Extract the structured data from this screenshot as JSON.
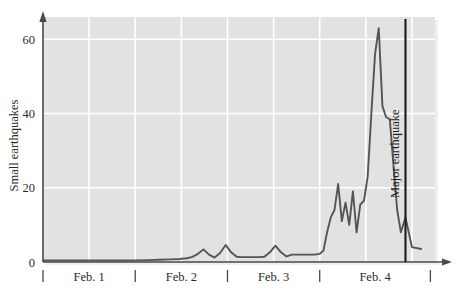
{
  "chart_data": {
    "type": "line",
    "title": "",
    "xlabel": "",
    "ylabel": "Small earthquakes",
    "ylim": [
      0,
      66
    ],
    "yticks": [
      0,
      20,
      40,
      60
    ],
    "ytick_labels": [
      "0",
      "20",
      "40",
      "60"
    ],
    "grid": true,
    "grid_color": "#ffffff",
    "plot_bg": "#e2e2e2",
    "line_color": "#555555",
    "axis_color": "#4a4a4a",
    "legend": "none",
    "categories": [
      "Feb. 1",
      "Feb. 2",
      "Feb. 3",
      "Feb. 4"
    ],
    "xlim": [
      0,
      4.25
    ],
    "xtick_positions": [
      0,
      1,
      2,
      3,
      4.2
    ],
    "annotations": [
      {
        "text": "Major earthquake",
        "type": "vertical-line",
        "x": 3.93,
        "color": "#1c1c1c",
        "orientation": "vertical-text"
      }
    ],
    "series": [
      {
        "name": "Small earthquakes",
        "x": [
          0.0,
          0.2,
          0.4,
          0.6,
          0.8,
          1.0,
          1.15,
          1.25,
          1.38,
          1.48,
          1.56,
          1.62,
          1.68,
          1.74,
          1.8,
          1.86,
          1.92,
          1.98,
          2.04,
          2.1,
          2.16,
          2.22,
          2.28,
          2.34,
          2.4,
          2.46,
          2.52,
          2.58,
          2.64,
          2.7,
          2.76,
          2.82,
          2.88,
          2.94,
          3.0,
          3.04,
          3.08,
          3.12,
          3.16,
          3.2,
          3.24,
          3.28,
          3.32,
          3.36,
          3.4,
          3.44,
          3.48,
          3.52,
          3.56,
          3.6,
          3.64,
          3.68,
          3.72,
          3.76,
          3.8,
          3.84,
          3.88,
          3.93,
          4.0,
          4.1
        ],
        "y": [
          0.4,
          0.4,
          0.4,
          0.4,
          0.4,
          0.4,
          0.5,
          0.6,
          0.7,
          0.8,
          1.0,
          1.4,
          2.2,
          3.4,
          2.0,
          1.2,
          2.4,
          4.6,
          2.6,
          1.4,
          1.3,
          1.3,
          1.3,
          1.3,
          1.4,
          2.6,
          4.4,
          2.6,
          1.5,
          2.0,
          2.0,
          2.0,
          2.0,
          2.0,
          2.2,
          3.0,
          8.0,
          12.0,
          14.0,
          21.0,
          11.0,
          16.0,
          10.0,
          19.0,
          8.0,
          15.5,
          16.5,
          23.0,
          40.0,
          56.0,
          63.0,
          42.0,
          39.0,
          38.5,
          26.0,
          14.0,
          8.0,
          12.0,
          4.0,
          3.5
        ]
      }
    ]
  }
}
